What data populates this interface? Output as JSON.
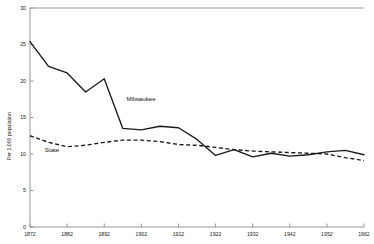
{
  "chart_data": {
    "type": "line",
    "title": "",
    "xlabel": "",
    "ylabel": "Per 1,000 population",
    "xlim": [
      1872,
      1962
    ],
    "ylim": [
      0,
      30
    ],
    "grid": false,
    "legend_position": "inline-annotation",
    "x_ticks": [
      1872,
      1882,
      1892,
      1902,
      1912,
      1922,
      1932,
      1942,
      1952,
      1962
    ],
    "x_tick_labels": [
      "1872",
      "1882",
      "1892",
      "1902",
      "1912",
      "1922",
      "1932",
      "1942",
      "1952",
      "1962"
    ],
    "y_ticks": [
      0,
      5,
      10,
      15,
      20,
      25,
      30
    ],
    "y_tick_labels": [
      "0",
      "5",
      "10",
      "15",
      "20",
      "25",
      "30"
    ],
    "x": [
      1872,
      1877,
      1882,
      1887,
      1892,
      1897,
      1902,
      1907,
      1912,
      1917,
      1922,
      1927,
      1932,
      1937,
      1942,
      1947,
      1952,
      1957,
      1962
    ],
    "series": [
      {
        "name": "Milwaukee",
        "style": "solid",
        "values": [
          25.4,
          22.0,
          21.1,
          18.5,
          20.3,
          13.5,
          13.3,
          13.8,
          13.6,
          12.0,
          9.8,
          10.6,
          9.6,
          10.1,
          9.7,
          9.9,
          10.3,
          10.5,
          9.9
        ]
      },
      {
        "name": "State",
        "style": "dashed",
        "values": [
          12.5,
          11.6,
          11.0,
          11.2,
          11.6,
          11.9,
          11.9,
          11.7,
          11.3,
          11.2,
          10.9,
          10.6,
          10.4,
          10.3,
          10.2,
          10.1,
          10.0,
          9.5,
          9.1
        ]
      }
    ],
    "annotations": [
      {
        "text": "Milwaukee",
        "x": 1898,
        "y": 17.2
      },
      {
        "text": "State",
        "x": 1876,
        "y": 10.3
      }
    ]
  },
  "labels": {
    "y_axis_title": "Per 1,000 population",
    "series_milwaukee": "Milwaukee",
    "series_state": "State"
  }
}
